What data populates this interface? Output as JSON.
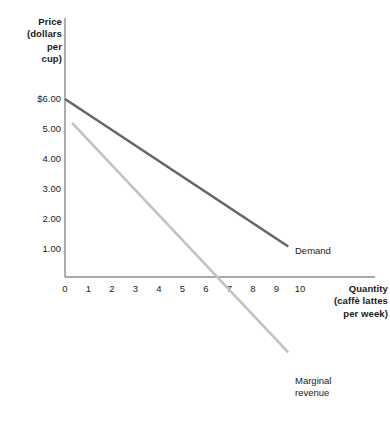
{
  "chart_data": {
    "type": "line",
    "title": "",
    "xlabel": "Quantity\n(caffè lattes\nper week)",
    "ylabel": "Price\n(dollars\nper\ncup)",
    "xlim": [
      0,
      11.5
    ],
    "ylim": [
      -3.0,
      6.6
    ],
    "grid": false,
    "legend_position": "inline-right",
    "xticks": [
      {
        "value": 0,
        "label": "0"
      },
      {
        "value": 1,
        "label": "1"
      },
      {
        "value": 2,
        "label": "2"
      },
      {
        "value": 3,
        "label": "3"
      },
      {
        "value": 4,
        "label": "4"
      },
      {
        "value": 5,
        "label": "5"
      },
      {
        "value": 6,
        "label": "6"
      },
      {
        "value": 7,
        "label": "7"
      },
      {
        "value": 8,
        "label": "8"
      },
      {
        "value": 9,
        "label": "9"
      },
      {
        "value": 10,
        "label": "10"
      }
    ],
    "yticks": [
      {
        "value": 6,
        "label": "$6.00"
      },
      {
        "value": 5,
        "label": "5.00"
      },
      {
        "value": 4,
        "label": "4.00"
      },
      {
        "value": 3,
        "label": "3.00"
      },
      {
        "value": 2,
        "label": "2.00"
      },
      {
        "value": 1,
        "label": "1.00"
      }
    ],
    "series": [
      {
        "name": "Demand",
        "label": "Demand",
        "color": "#666666",
        "width": 2.6,
        "points": [
          [
            0,
            6.0
          ],
          [
            9.5,
            1.05
          ]
        ]
      },
      {
        "name": "Marginal revenue",
        "label": "Marginal\nrevenue",
        "color": "#c2c2c2",
        "width": 2.6,
        "points": [
          [
            0.3,
            5.2
          ],
          [
            9.5,
            -2.5
          ]
        ]
      }
    ],
    "axis_color": "#8c8c8c",
    "annotations": []
  }
}
